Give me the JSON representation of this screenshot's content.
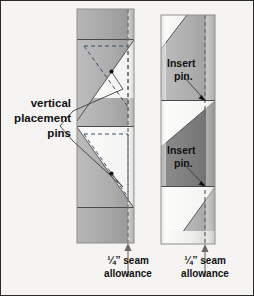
{
  "figure": {
    "background_color": "#f5f4f2",
    "border_color": "#2b2b2b"
  },
  "left_panel": {
    "name": "vertical-placement-strip",
    "callout": {
      "line1": "vertical",
      "line2": "placement",
      "line3": "pins"
    },
    "seam_note": {
      "line1": "¼ˮ seam",
      "line2": "allowance"
    }
  },
  "right_panel": {
    "name": "insert-pin-strip",
    "callout_top": {
      "line1": "Insert",
      "line2": "pin."
    },
    "callout_bottom": {
      "line1": "Insert",
      "line2": "pin."
    },
    "seam_note": {
      "line1": "¼ˮ seam",
      "line2": "allowance"
    }
  },
  "colors": {
    "fabric_mid_gray": "#a8a8a8",
    "fabric_dark_gray": "#7d7d7d",
    "fabric_light": "#fbfbfa",
    "seam_dash": "#6e6e6e",
    "fold_dash": "#3a4a70",
    "outline": "#8d8d8d",
    "text": "#111111"
  }
}
